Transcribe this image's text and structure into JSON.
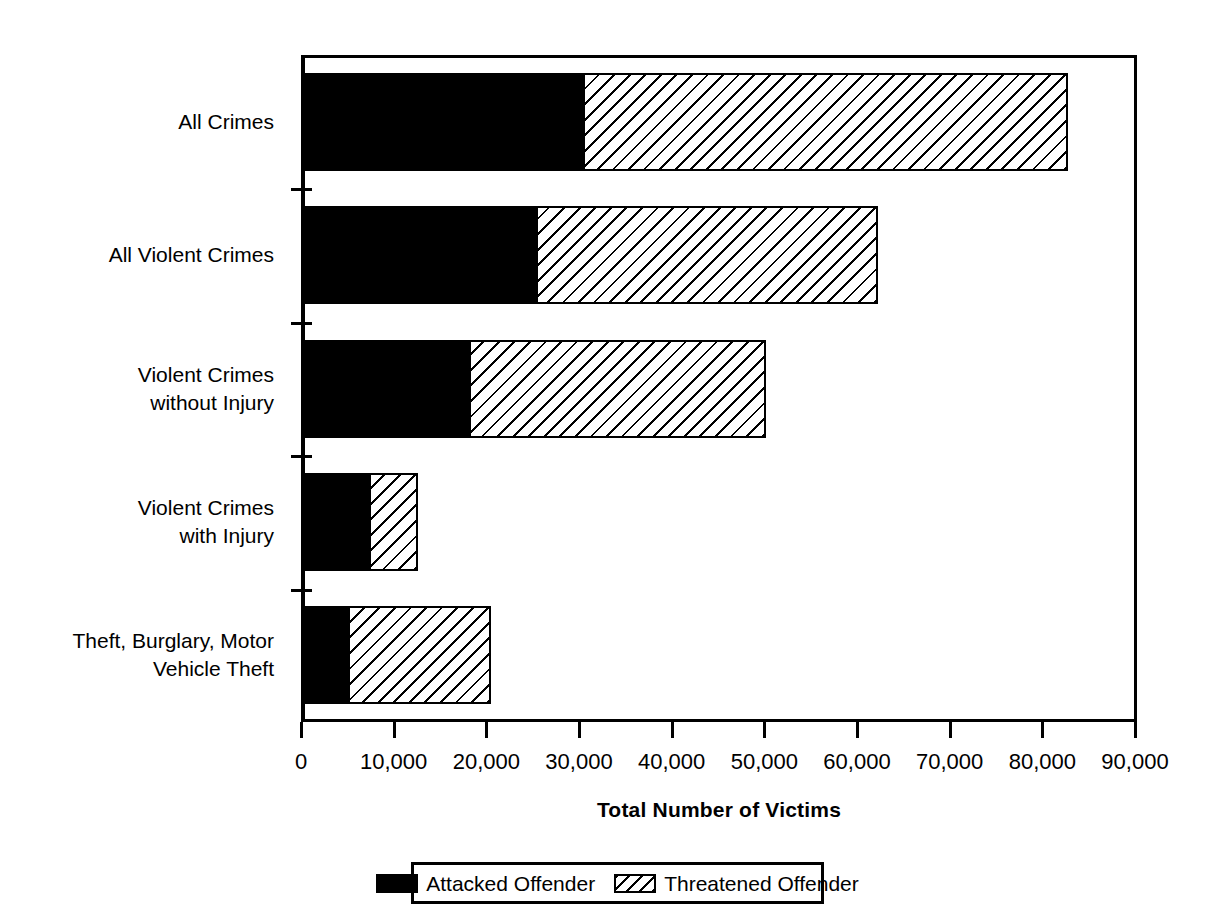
{
  "chart_data": {
    "type": "bar",
    "orientation": "horizontal",
    "stacked": true,
    "title": "",
    "xlabel": "Total Number of Victims",
    "ylabel": "",
    "xlim": [
      0,
      90000
    ],
    "xticks": [
      0,
      10000,
      20000,
      30000,
      40000,
      50000,
      60000,
      70000,
      80000,
      90000
    ],
    "xtick_labels": [
      "0",
      "10,000",
      "20,000",
      "30,000",
      "40,000",
      "50,000",
      "60,000",
      "70,000",
      "80,000",
      "90,000"
    ],
    "grid": false,
    "legend_position": "bottom",
    "categories": [
      "All Crimes",
      "All Violent Crimes",
      "Violent Crimes without Injury",
      "Violent Crimes with Injury",
      "Theft, Burglary, Motor Vehicle Theft"
    ],
    "category_label_lines": [
      [
        "All Crimes"
      ],
      [
        "All Violent Crimes"
      ],
      [
        "Violent Crimes",
        "without Injury"
      ],
      [
        "Violent Crimes",
        "with Injury"
      ],
      [
        "Theft, Burglary, Motor",
        "Vehicle Theft"
      ]
    ],
    "series": [
      {
        "name": "Attacked Offender",
        "fill": "solid-black",
        "color": "#000000",
        "values": [
          30400,
          25400,
          18100,
          7300,
          5100
        ]
      },
      {
        "name": "Threatened Offender",
        "fill": "diagonal-hatch",
        "color": "#ffffff",
        "values": [
          52200,
          36700,
          31900,
          5100,
          15200
        ]
      }
    ],
    "totals": [
      82600,
      62100,
      50000,
      12400,
      20300
    ]
  },
  "legend": {
    "items": [
      {
        "label": "Attacked Offender",
        "swatch": "solid-black-swatch"
      },
      {
        "label": "Threatened Offender",
        "swatch": "diagonal-hatch-swatch"
      }
    ]
  },
  "axis": {
    "x_title": "Total Number of Victims"
  },
  "colors": {
    "attacked": "#000000",
    "threatened": "#ffffff",
    "axis": "#000000",
    "background": "#ffffff"
  }
}
